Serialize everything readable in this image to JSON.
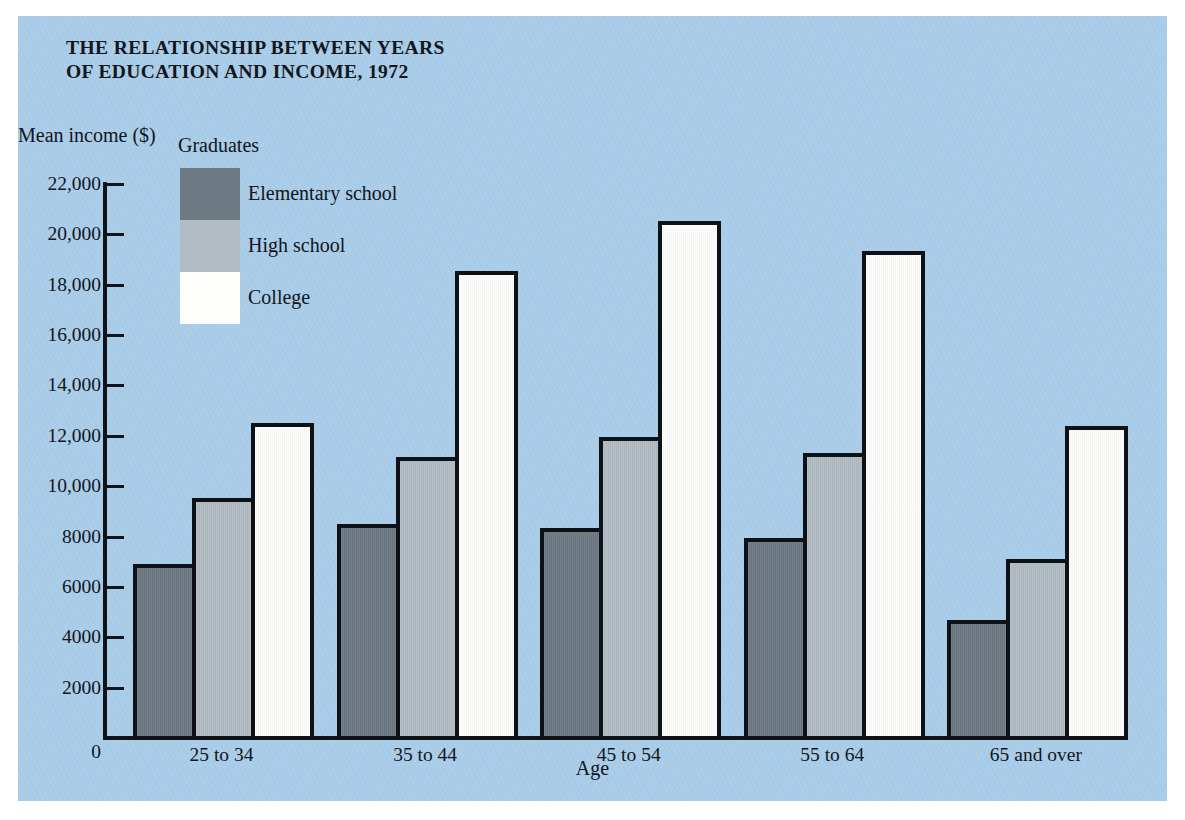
{
  "figure": {
    "title": "THE RELATIONSHIP BETWEEN YEARS\nOF EDUCATION AND INCOME, 1972",
    "background_color": "#a9cce8",
    "frame_color": "#ffffff"
  },
  "legend": {
    "title": "Graduates",
    "position": "inside-top-left",
    "entries": [
      {
        "label": "Elementary school",
        "color": "#6d7983",
        "key": "elementary"
      },
      {
        "label": "High school",
        "color": "#b2bcc3",
        "key": "high"
      },
      {
        "label": "College",
        "color": "#fdfdfb",
        "key": "college"
      }
    ]
  },
  "axes": {
    "ylabel": "Mean income ($)",
    "xlabel": "Age",
    "ytick_labels": [
      "22,000",
      "20,000",
      "18,000",
      "16,000",
      "14,000",
      "12,000",
      "10,000",
      "8000",
      "6000",
      "4000",
      "2000",
      "0"
    ],
    "ytick_values": [
      22000,
      20000,
      18000,
      16000,
      14000,
      12000,
      10000,
      8000,
      6000,
      4000,
      2000,
      0
    ],
    "zero_label": "0"
  },
  "chart_data": {
    "type": "bar",
    "title": "THE RELATIONSHIP BETWEEN YEARS OF EDUCATION AND INCOME, 1972",
    "xlabel": "Age",
    "ylabel": "Mean income ($)",
    "ylim": [
      0,
      22000
    ],
    "ytick_step": 2000,
    "grid": false,
    "legend_title": "Graduates",
    "legend_position": "inside-top-left",
    "categories": [
      "25 to 34",
      "35 to 44",
      "45 to 54",
      "55 to 64",
      "65 and over"
    ],
    "series": [
      {
        "name": "Elementary school",
        "color": "#6d7983",
        "values": [
          6900,
          8500,
          8350,
          7950,
          4700
        ]
      },
      {
        "name": "High school",
        "color": "#b2bcc3",
        "values": [
          9550,
          11150,
          11950,
          11300,
          7100
        ]
      },
      {
        "name": "College",
        "color": "#fdfdfb",
        "values": [
          12500,
          18550,
          20550,
          19350,
          12400
        ]
      }
    ]
  }
}
